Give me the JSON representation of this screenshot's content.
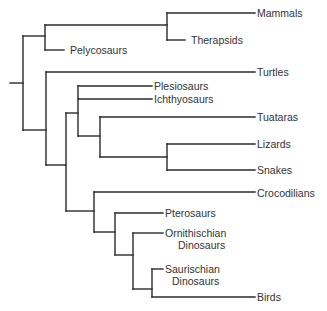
{
  "diagram": {
    "type": "phylogenetic-tree (cladogram)",
    "line_color": "#2a2a2a",
    "text_color": "#333333",
    "background": "#ffffff"
  },
  "taxa": [
    {
      "id": "mammals",
      "label": "Mammals",
      "x": 257,
      "y": 13
    },
    {
      "id": "therapsids",
      "label": "Therapsids",
      "x": 191,
      "y": 40
    },
    {
      "id": "pelycosaurs",
      "label": "Pelycosaurs",
      "x": 70,
      "y": 50
    },
    {
      "id": "turtles",
      "label": "Turtles",
      "x": 257,
      "y": 72
    },
    {
      "id": "plesiosaurs",
      "label": "Plesiosaurs",
      "x": 154,
      "y": 86
    },
    {
      "id": "ichthyosaurs",
      "label": "Ichthyosaurs",
      "x": 154,
      "y": 99
    },
    {
      "id": "tuataras",
      "label": "Tuataras",
      "x": 257,
      "y": 117
    },
    {
      "id": "lizards",
      "label": "Lizards",
      "x": 257,
      "y": 144
    },
    {
      "id": "snakes",
      "label": "Snakes",
      "x": 257,
      "y": 170
    },
    {
      "id": "crocodilians",
      "label": "Crocodilians",
      "x": 257,
      "y": 193
    },
    {
      "id": "pterosaurs",
      "label": "Pterosaurs",
      "x": 165,
      "y": 213
    },
    {
      "id": "ornithischian",
      "label": "Ornithischian",
      "label2": "Dinosaurs",
      "x": 165,
      "y": 233,
      "x2": 178
    },
    {
      "id": "saurischian",
      "label": "Saurischian",
      "label2": "Dinosaurs",
      "x": 165,
      "y": 269,
      "x2": 172
    },
    {
      "id": "birds",
      "label": "Birds",
      "x": 257,
      "y": 297
    }
  ],
  "branches": [
    [
      10,
      83,
      23,
      83
    ],
    [
      23,
      36,
      23,
      130
    ],
    [
      23,
      36,
      45,
      36
    ],
    [
      45,
      25,
      45,
      50
    ],
    [
      45,
      50,
      64,
      50
    ],
    [
      45,
      25,
      167,
      25
    ],
    [
      167,
      13,
      167,
      40
    ],
    [
      167,
      13,
      255,
      13
    ],
    [
      167,
      40,
      185,
      40
    ],
    [
      23,
      130,
      46,
      130
    ],
    [
      46,
      72,
      46,
      165
    ],
    [
      46,
      72,
      255,
      72
    ],
    [
      46,
      165,
      66,
      165
    ],
    [
      66,
      113,
      66,
      211
    ],
    [
      66,
      113,
      78,
      113
    ],
    [
      78,
      86,
      78,
      136
    ],
    [
      78,
      86,
      152,
      86
    ],
    [
      78,
      99,
      152,
      99
    ],
    [
      78,
      136,
      100,
      136
    ],
    [
      100,
      117,
      100,
      157
    ],
    [
      100,
      117,
      255,
      117
    ],
    [
      100,
      157,
      167,
      157
    ],
    [
      167,
      144,
      167,
      170
    ],
    [
      167,
      144,
      255,
      144
    ],
    [
      167,
      170,
      255,
      170
    ],
    [
      66,
      211,
      94,
      211
    ],
    [
      94,
      192,
      94,
      232
    ],
    [
      94,
      192,
      255,
      192
    ],
    [
      94,
      232,
      115,
      232
    ],
    [
      115,
      213,
      115,
      255
    ],
    [
      115,
      213,
      163,
      213
    ],
    [
      115,
      255,
      133,
      255
    ],
    [
      133,
      233,
      133,
      289
    ],
    [
      133,
      233,
      163,
      233
    ],
    [
      133,
      289,
      152,
      289
    ],
    [
      152,
      269,
      152,
      297
    ],
    [
      152,
      269,
      163,
      269
    ],
    [
      152,
      297,
      255,
      297
    ]
  ]
}
